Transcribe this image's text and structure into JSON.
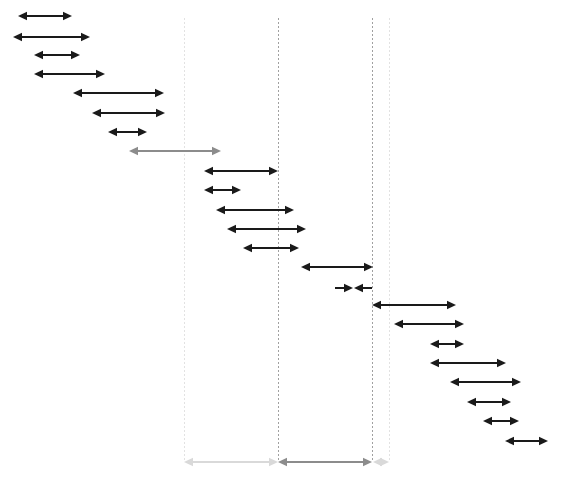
{
  "canvas": {
    "width": 568,
    "height": 478,
    "background": "#ffffff"
  },
  "style": {
    "arrow_color_primary": "#1a1a1a",
    "arrow_color_muted": "#8c8c8c",
    "arrow_color_faint": "#d9d9d9",
    "guide_color_dark": "#a0a0a0",
    "guide_color_light": "#e2e2e2",
    "line_width": 1.4,
    "head_length": 9,
    "head_half_width": 4.2
  },
  "chart_data": {
    "type": "interval-cascade",
    "title": "",
    "subtitle": "",
    "xlabel": "",
    "ylabel": "",
    "xlim": [
      0,
      568
    ],
    "ylim": [
      0,
      478
    ],
    "grid": false,
    "legend": "none",
    "guides": [
      {
        "id": "guide-1",
        "x": 184,
        "y_top": 18,
        "y_bottom": 462,
        "tone": "light"
      },
      {
        "id": "guide-2",
        "x": 278,
        "y_top": 18,
        "y_bottom": 462,
        "tone": "dark"
      },
      {
        "id": "guide-3",
        "x": 372,
        "y_top": 18,
        "y_bottom": 462,
        "tone": "dark"
      },
      {
        "id": "guide-4",
        "x": 389,
        "y_top": 18,
        "y_bottom": 462,
        "tone": "light"
      }
    ],
    "intervals": [
      {
        "id": 1,
        "x1": 18,
        "x2": 72,
        "y": 16,
        "tone": "primary",
        "left_head": true,
        "right_head": true
      },
      {
        "id": 2,
        "x1": 13,
        "x2": 90,
        "y": 37,
        "tone": "primary",
        "left_head": true,
        "right_head": true
      },
      {
        "id": 3,
        "x1": 34,
        "x2": 80,
        "y": 55,
        "tone": "primary",
        "left_head": true,
        "right_head": true
      },
      {
        "id": 4,
        "x1": 34,
        "x2": 105,
        "y": 74,
        "tone": "primary",
        "left_head": true,
        "right_head": true
      },
      {
        "id": 5,
        "x1": 73,
        "x2": 164,
        "y": 93,
        "tone": "primary",
        "left_head": true,
        "right_head": true
      },
      {
        "id": 6,
        "x1": 92,
        "x2": 165,
        "y": 113,
        "tone": "primary",
        "left_head": true,
        "right_head": true
      },
      {
        "id": 7,
        "x1": 108,
        "x2": 147,
        "y": 132,
        "tone": "primary",
        "left_head": true,
        "right_head": true
      },
      {
        "id": 8,
        "x1": 129,
        "x2": 221,
        "y": 151,
        "tone": "muted",
        "left_head": true,
        "right_head": true
      },
      {
        "id": 9,
        "x1": 204,
        "x2": 278,
        "y": 171,
        "tone": "primary",
        "left_head": true,
        "right_head": true
      },
      {
        "id": 10,
        "x1": 204,
        "x2": 241,
        "y": 190,
        "tone": "primary",
        "left_head": true,
        "right_head": true
      },
      {
        "id": 11,
        "x1": 216,
        "x2": 294,
        "y": 210,
        "tone": "primary",
        "left_head": true,
        "right_head": true
      },
      {
        "id": 12,
        "x1": 227,
        "x2": 306,
        "y": 229,
        "tone": "primary",
        "left_head": true,
        "right_head": true
      },
      {
        "id": 13,
        "x1": 243,
        "x2": 299,
        "y": 248,
        "tone": "primary",
        "left_head": true,
        "right_head": true
      },
      {
        "id": 14,
        "x1": 301,
        "x2": 373,
        "y": 267,
        "tone": "primary",
        "left_head": true,
        "right_head": true
      },
      {
        "id": 16,
        "x1": 372,
        "x2": 456,
        "y": 305,
        "tone": "primary",
        "left_head": true,
        "right_head": true
      },
      {
        "id": 17,
        "x1": 394,
        "x2": 464,
        "y": 324,
        "tone": "primary",
        "left_head": true,
        "right_head": true
      },
      {
        "id": 18,
        "x1": 430,
        "x2": 464,
        "y": 344,
        "tone": "primary",
        "left_head": true,
        "right_head": true
      },
      {
        "id": 19,
        "x1": 430,
        "x2": 506,
        "y": 363,
        "tone": "primary",
        "left_head": true,
        "right_head": true
      },
      {
        "id": 20,
        "x1": 450,
        "x2": 521,
        "y": 382,
        "tone": "primary",
        "left_head": true,
        "right_head": true
      },
      {
        "id": 21,
        "x1": 467,
        "x2": 511,
        "y": 402,
        "tone": "primary",
        "left_head": true,
        "right_head": true
      },
      {
        "id": 22,
        "x1": 483,
        "x2": 519,
        "y": 421,
        "tone": "primary",
        "left_head": true,
        "right_head": true
      },
      {
        "id": 23,
        "x1": 505,
        "x2": 548,
        "y": 441,
        "tone": "primary",
        "left_head": true,
        "right_head": true
      }
    ],
    "converging_pair": {
      "id": 15,
      "y": 288,
      "tone": "primary",
      "left_segment": {
        "x1": 335,
        "x2": 353,
        "head_at": "right"
      },
      "right_segment": {
        "x1": 372,
        "x2": 354,
        "head_at": "left"
      }
    },
    "summary_bar": {
      "y": 462,
      "segments": [
        {
          "id": "summary-left",
          "x1": 184,
          "x2": 278,
          "tone": "faint",
          "left_head": true,
          "right_head": true
        },
        {
          "id": "summary-center",
          "x1": 278,
          "x2": 372,
          "tone": "muted",
          "left_head": true,
          "right_head": true
        },
        {
          "id": "summary-right",
          "x1": 373,
          "x2": 389,
          "tone": "faint",
          "left_head": true,
          "right_head": true
        }
      ]
    }
  }
}
